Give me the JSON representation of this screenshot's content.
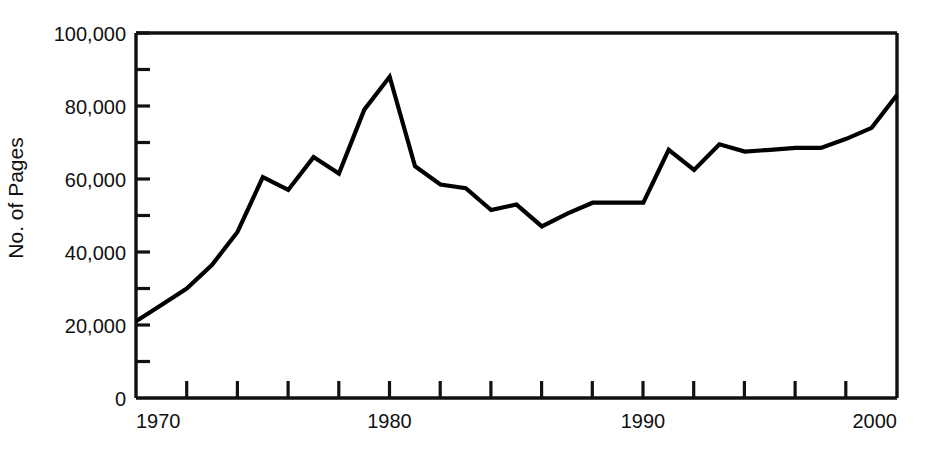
{
  "chart_data": {
    "type": "line",
    "title": "",
    "xlabel": "",
    "ylabel": "No. of Pages",
    "xlim": [
      1970,
      2000
    ],
    "ylim": [
      0,
      100000
    ],
    "grid": false,
    "legend": null,
    "x_tick_labels": [
      "1970",
      "1980",
      "1990",
      "2000"
    ],
    "x_tick_values": [
      1970,
      1980,
      1990,
      2000
    ],
    "x_minor_tick_interval": 2,
    "y_tick_labels": [
      "0",
      "20,000",
      "40,000",
      "60,000",
      "80,000",
      "100,000"
    ],
    "y_tick_values": [
      0,
      20000,
      40000,
      60000,
      80000,
      100000
    ],
    "y_minor_tick_interval": 10000,
    "line_color": "#000000",
    "x": [
      1970,
      1971,
      1972,
      1973,
      1974,
      1975,
      1976,
      1977,
      1978,
      1979,
      1980,
      1981,
      1982,
      1983,
      1984,
      1985,
      1986,
      1987,
      1988,
      1989,
      1990,
      1991,
      1992,
      1993,
      1994,
      1995,
      1996,
      1997,
      1998,
      1999,
      2000
    ],
    "values": [
      21000,
      25500,
      30000,
      36500,
      45500,
      60500,
      57000,
      66000,
      61500,
      79000,
      88000,
      63500,
      58500,
      57500,
      51500,
      53000,
      47000,
      50500,
      53500,
      53500,
      53500,
      68000,
      62500,
      69500,
      67500,
      68000,
      68500,
      68500,
      71000,
      74000,
      83000
    ]
  },
  "axes": {
    "y_label": "No. of Pages",
    "y_ticks": [
      {
        "label": "100,000",
        "value": 100000
      },
      {
        "label": "80,000",
        "value": 80000
      },
      {
        "label": "60,000",
        "value": 60000
      },
      {
        "label": "40,000",
        "value": 40000
      },
      {
        "label": "20,000",
        "value": 20000
      },
      {
        "label": "0",
        "value": 0
      }
    ],
    "x_ticks": [
      {
        "label": "1970",
        "value": 1970
      },
      {
        "label": "1980",
        "value": 1980
      },
      {
        "label": "1990",
        "value": 1990
      },
      {
        "label": "2000",
        "value": 2000
      }
    ]
  }
}
